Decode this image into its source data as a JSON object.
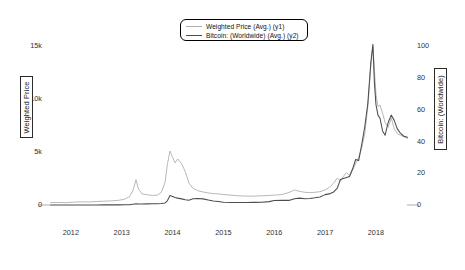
{
  "chart_data": {
    "type": "line",
    "title": "",
    "xlabel": "",
    "grid": false,
    "legend_position": "top-center",
    "x_axis": {
      "tick_labels": [
        "2012",
        "2013",
        "2014",
        "2015",
        "2016",
        "2017",
        "2018"
      ],
      "tick_values": [
        2012,
        2013,
        2014,
        2015,
        2016,
        2017,
        2018
      ],
      "range": [
        2011.55,
        2018.65
      ]
    },
    "y1_axis": {
      "label": "Weighted Price",
      "tick_labels": [
        "0",
        "5k",
        "10k",
        "15k"
      ],
      "tick_values": [
        0,
        5000,
        10000,
        15000
      ],
      "range": [
        0,
        15600
      ]
    },
    "y2_axis": {
      "label": "Bitcoin: (Worldwide)",
      "tick_labels": [
        "0",
        "20",
        "40",
        "60",
        "80",
        "100"
      ],
      "tick_values": [
        0,
        20,
        40,
        60,
        80,
        100
      ],
      "range": [
        0,
        104
      ]
    },
    "series": [
      {
        "name": "Weighted Price (Avg.) (y1)",
        "legend_label": "Weighted Price (Avg.) (y1)",
        "axis": "y2",
        "color": "#b0b0b0",
        "width": 0.9,
        "x": [
          2011.6,
          2011.75,
          2011.9,
          2012.05,
          2012.2,
          2012.35,
          2012.5,
          2012.65,
          2012.8,
          2012.95,
          2013.05,
          2013.15,
          2013.22,
          2013.28,
          2013.33,
          2013.4,
          2013.5,
          2013.6,
          2013.7,
          2013.78,
          2013.85,
          2013.9,
          2013.95,
          2014.0,
          2014.05,
          2014.1,
          2014.18,
          2014.25,
          2014.32,
          2014.4,
          2014.5,
          2014.6,
          2014.7,
          2014.8,
          2014.9,
          2015.0,
          2015.15,
          2015.3,
          2015.45,
          2015.6,
          2015.75,
          2015.9,
          2016.0,
          2016.15,
          2016.3,
          2016.4,
          2016.5,
          2016.6,
          2016.7,
          2016.8,
          2016.9,
          2017.0,
          2017.08,
          2017.16,
          2017.24,
          2017.3,
          2017.36,
          2017.42,
          2017.48,
          2017.54,
          2017.6,
          2017.66,
          2017.72,
          2017.78,
          2017.84,
          2017.9,
          2017.94,
          2017.97,
          2018.0,
          2018.04,
          2018.08,
          2018.13,
          2018.18,
          2018.24,
          2018.3,
          2018.36,
          2018.42,
          2018.48,
          2018.55,
          2018.62
        ],
        "y": [
          1.5,
          1.6,
          1.5,
          1.8,
          2.0,
          1.9,
          2.2,
          2.4,
          2.6,
          3.0,
          3.6,
          5.2,
          9.0,
          16.0,
          10.0,
          7.0,
          6.5,
          6.0,
          6.2,
          8.0,
          14.0,
          26.0,
          34.0,
          30.0,
          26.5,
          29.0,
          26.0,
          21.0,
          14.0,
          10.5,
          9.0,
          8.2,
          7.6,
          7.2,
          7.0,
          6.6,
          6.2,
          5.8,
          5.6,
          5.6,
          5.8,
          6.0,
          6.2,
          6.6,
          8.0,
          9.5,
          8.6,
          8.0,
          7.8,
          8.0,
          8.4,
          9.5,
          11.0,
          13.5,
          17.0,
          15.0,
          18.0,
          20.5,
          18.5,
          22.0,
          26.0,
          30.0,
          36.0,
          45.0,
          62.0,
          88.0,
          100.0,
          85.0,
          70.0,
          62.0,
          63.0,
          58.0,
          52.0,
          49.0,
          55.0,
          48.0,
          45.0,
          44.0,
          43.0,
          42.0
        ]
      },
      {
        "name": "Bitcoin: (Worldwide) (Avg.) (y2)",
        "legend_label": "Bitcoin: (Worldwide) (Avg.) (y2)",
        "axis": "y1",
        "color": "#4d4d4d",
        "width": 1.05,
        "x": [
          2011.6,
          2011.75,
          2011.9,
          2012.05,
          2012.2,
          2012.35,
          2012.5,
          2012.65,
          2012.8,
          2012.95,
          2013.05,
          2013.15,
          2013.22,
          2013.28,
          2013.33,
          2013.4,
          2013.5,
          2013.6,
          2013.7,
          2013.78,
          2013.85,
          2013.9,
          2013.95,
          2014.0,
          2014.05,
          2014.1,
          2014.18,
          2014.25,
          2014.32,
          2014.4,
          2014.5,
          2014.6,
          2014.7,
          2014.8,
          2014.9,
          2015.0,
          2015.15,
          2015.3,
          2015.45,
          2015.6,
          2015.75,
          2015.9,
          2016.0,
          2016.15,
          2016.3,
          2016.4,
          2016.5,
          2016.6,
          2016.7,
          2016.8,
          2016.9,
          2017.0,
          2017.08,
          2017.16,
          2017.24,
          2017.3,
          2017.36,
          2017.42,
          2017.48,
          2017.54,
          2017.6,
          2017.66,
          2017.72,
          2017.78,
          2017.84,
          2017.9,
          2017.94,
          2017.97,
          2018.0,
          2018.04,
          2018.08,
          2018.13,
          2018.18,
          2018.24,
          2018.3,
          2018.36,
          2018.42,
          2018.48,
          2018.55,
          2018.62
        ],
        "y": [
          4,
          4,
          5,
          6,
          5,
          5,
          7,
          11,
          12,
          13,
          17,
          30,
          70,
          110,
          95,
          100,
          105,
          110,
          125,
          140,
          180,
          420,
          900,
          800,
          700,
          650,
          580,
          500,
          450,
          600,
          620,
          580,
          480,
          380,
          340,
          260,
          240,
          230,
          240,
          250,
          260,
          320,
          420,
          440,
          440,
          600,
          650,
          600,
          620,
          680,
          760,
          980,
          1050,
          1200,
          1600,
          2400,
          2500,
          2600,
          2700,
          3400,
          4300,
          4200,
          5700,
          7400,
          9600,
          13500,
          15200,
          11500,
          9500,
          8500,
          8200,
          7000,
          6600,
          7800,
          8500,
          8000,
          7200,
          6800,
          6500,
          6400
        ]
      }
    ]
  }
}
